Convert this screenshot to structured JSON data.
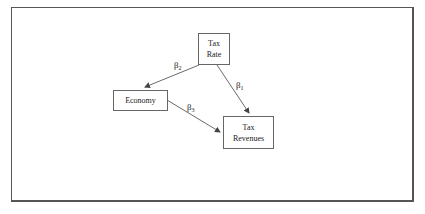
{
  "diagram": {
    "nodes": [
      {
        "id": "tax-rate",
        "lines": [
          "Tax",
          "Rate"
        ]
      },
      {
        "id": "economy",
        "lines": [
          "Economy"
        ]
      },
      {
        "id": "tax-revenues",
        "lines": [
          "Tax",
          "Revenues"
        ]
      }
    ],
    "edges": [
      {
        "from": "tax-rate",
        "to": "tax-revenues",
        "label": "β",
        "subscript": "1"
      },
      {
        "from": "tax-rate",
        "to": "economy",
        "label": "β",
        "subscript": "2"
      },
      {
        "from": "economy",
        "to": "tax-revenues",
        "label": "β",
        "subscript": "3"
      }
    ],
    "colors": {
      "line": "#444444",
      "border": "#666666",
      "background": "#ffffff"
    }
  }
}
